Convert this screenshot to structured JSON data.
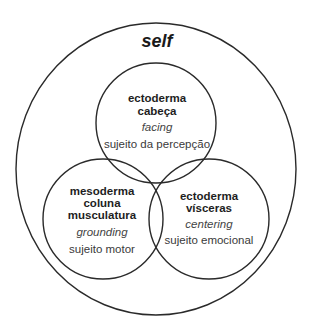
{
  "diagram": {
    "title": "self",
    "outer_circle": {
      "label": "self"
    },
    "circles": [
      {
        "id": "top",
        "lines_bold": [
          "ectoderma",
          "cabeça"
        ],
        "italic": "facing",
        "subtitle": "sujeito da percepção"
      },
      {
        "id": "bottom-left",
        "lines_bold": [
          "mesoderma",
          "coluna",
          "musculatura"
        ],
        "italic": "grounding",
        "subtitle": "sujeito motor"
      },
      {
        "id": "bottom-right",
        "lines_bold": [
          "ectoderma",
          "vísceras"
        ],
        "italic": "centering",
        "subtitle": "sujeito emocional"
      }
    ],
    "colors": {
      "stroke": "#2a2a2a",
      "bold_text": "#1e1e1e",
      "light_text": "#444444",
      "background": "#ffffff"
    }
  }
}
